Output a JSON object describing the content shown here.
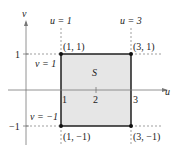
{
  "diagram": {
    "axes": {
      "horizontal_label": "u",
      "vertical_label": "v",
      "u_ticks": [
        "1",
        "2",
        "3"
      ],
      "v_ticks": [
        "1",
        "−1"
      ]
    },
    "region": {
      "label": "S",
      "fill": "#e6e6e6",
      "border": "#111111"
    },
    "boundary_labels": {
      "u_left": "u = 1",
      "u_right": "u = 3",
      "v_top": "v = 1",
      "v_bottom": "v = −1"
    },
    "vertices": [
      {
        "label": "(1, 1)"
      },
      {
        "label": "(3, 1)"
      },
      {
        "label": "(1, −1)"
      },
      {
        "label": "(3, −1)"
      }
    ]
  }
}
